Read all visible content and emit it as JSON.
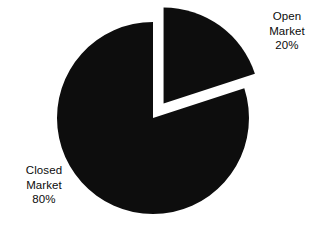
{
  "chart_data": {
    "type": "pie",
    "title": "",
    "subtitle": "",
    "xlabel": "",
    "ylabel": "",
    "legend": "none",
    "grid": false,
    "units": "percent",
    "total": 100,
    "start_angle_deg": 0,
    "direction": "clockwise",
    "categories": [
      "Open Market",
      "Closed Market"
    ],
    "values": [
      20,
      80
    ],
    "slices": [
      {
        "name": "Open Market",
        "value": 20,
        "value_text": "20%",
        "label_line1": "Open",
        "label_line2": "Market",
        "label_line3": "20%",
        "color": "#0d0d0d",
        "exploded": true,
        "explode_offset_px": 18,
        "start_angle_deg": 0,
        "end_angle_deg": 72
      },
      {
        "name": "Closed Market",
        "value": 80,
        "value_text": "80%",
        "label_line1": "Closed",
        "label_line2": "Market",
        "label_line3": "80%",
        "color": "#0d0d0d",
        "exploded": false,
        "explode_offset_px": 0,
        "start_angle_deg": 72,
        "end_angle_deg": 360
      }
    ]
  },
  "geometry": {
    "center_x": 153,
    "center_y": 118,
    "radius": 96
  },
  "colors": {
    "background": "#ffffff",
    "slice_fill": "#0d0d0d",
    "label_text": "#0b0b0b"
  }
}
